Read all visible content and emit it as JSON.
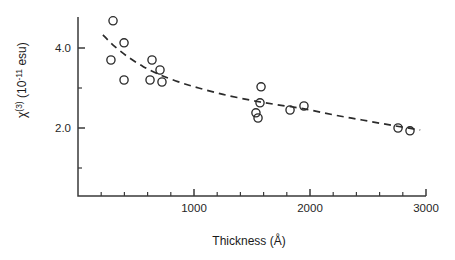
{
  "chart_data": {
    "type": "scatter",
    "title": "",
    "xlabel": "Thickness (Å)",
    "ylabel": "χ(3) (10-11 esu)",
    "ylabel_parts": {
      "symbol": "χ",
      "superscript": "(3)",
      "units_prefix": " (10",
      "units_exponent": "-11",
      "units_suffix": " esu)"
    },
    "xlim": [
      0,
      3000
    ],
    "ylim": [
      0,
      5.2
    ],
    "grid": false,
    "legend": null,
    "xticks_major": [
      1000,
      2000,
      3000
    ],
    "xticklabels": [
      "1000",
      "2000",
      "3000"
    ],
    "xticks_minor": [
      200,
      400,
      600,
      800,
      1200,
      1400,
      1600,
      1800,
      2200,
      2400,
      2600,
      2800
    ],
    "yticks_major": [
      2.0,
      4.0
    ],
    "yticklabels": [
      "2.0",
      "4.0"
    ],
    "yticks_minor": [
      1.0,
      3.0,
      5.0
    ],
    "marker": "open-circle",
    "points": [
      {
        "x": 302,
        "y": 4.68
      },
      {
        "x": 397,
        "y": 4.13
      },
      {
        "x": 284,
        "y": 3.7
      },
      {
        "x": 397,
        "y": 3.2
      },
      {
        "x": 638,
        "y": 3.7
      },
      {
        "x": 707,
        "y": 3.45
      },
      {
        "x": 621,
        "y": 3.2
      },
      {
        "x": 724,
        "y": 3.15
      },
      {
        "x": 1578,
        "y": 3.03
      },
      {
        "x": 1569,
        "y": 2.63
      },
      {
        "x": 1534,
        "y": 2.38
      },
      {
        "x": 1552,
        "y": 2.25
      },
      {
        "x": 1828,
        "y": 2.45
      },
      {
        "x": 1948,
        "y": 2.55
      },
      {
        "x": 2759,
        "y": 2.0
      },
      {
        "x": 2862,
        "y": 1.93
      }
    ],
    "fit_curve": {
      "style": "dashed",
      "points": [
        {
          "x": 215,
          "y": 4.33
        },
        {
          "x": 300,
          "y": 4.08
        },
        {
          "x": 420,
          "y": 3.8
        },
        {
          "x": 560,
          "y": 3.54
        },
        {
          "x": 700,
          "y": 3.34
        },
        {
          "x": 860,
          "y": 3.16
        },
        {
          "x": 1040,
          "y": 3.0
        },
        {
          "x": 1250,
          "y": 2.84
        },
        {
          "x": 1480,
          "y": 2.7
        },
        {
          "x": 1700,
          "y": 2.59
        },
        {
          "x": 1950,
          "y": 2.48
        },
        {
          "x": 2200,
          "y": 2.33
        },
        {
          "x": 2450,
          "y": 2.2
        },
        {
          "x": 2700,
          "y": 2.07
        },
        {
          "x": 2950,
          "y": 1.95
        }
      ]
    },
    "colors": {
      "axis": "#3a3a3a",
      "marker": "#2b2b2b",
      "curve": "#2b2b2b",
      "text": "#1a1a1a",
      "background": "#ffffff"
    }
  }
}
